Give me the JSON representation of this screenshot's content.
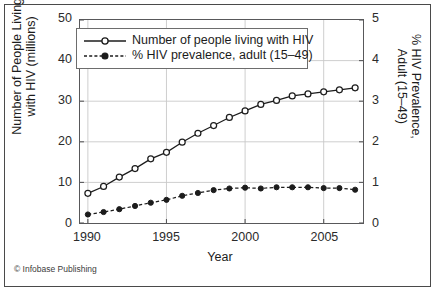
{
  "credit": "© Infobase Publishing",
  "legend": {
    "position": "upper-left-inside",
    "entries": [
      {
        "label": "Number of people living with HIV",
        "marker": "open-circle",
        "line": "solid"
      },
      {
        "label": "% HIV prevalence, adult (15–49)",
        "marker": "filled-circle",
        "line": "dashed"
      }
    ]
  },
  "colors": {
    "line": "#1c1c1c",
    "grid": "#c8c8c8",
    "axis": "#58585a",
    "frame": "#4a4a4a",
    "background": "#ffffff",
    "text": "#1c1c1c"
  },
  "chart_data": {
    "type": "line",
    "title": "",
    "xlabel": "Year",
    "ylabel": "Number of People Living\nwith HIV (millions)",
    "y2label": "% HIV Prevalence,\nAdult (15–49)",
    "xlim": [
      1989.5,
      2007.5
    ],
    "ylim": [
      0,
      50
    ],
    "y2lim": [
      0,
      5
    ],
    "grid": true,
    "xticks": [
      1990,
      1995,
      2000,
      2005
    ],
    "xticklabels": [
      "1990",
      "1995",
      "2000",
      "2005"
    ],
    "yticks": [
      0,
      10,
      20,
      30,
      40,
      50
    ],
    "yticklabels": [
      "0",
      "10",
      "20",
      "30",
      "40",
      "50"
    ],
    "y2ticks": [
      0,
      1,
      2,
      3,
      4,
      5
    ],
    "y2ticklabels": [
      "0",
      "1",
      "2",
      "3",
      "4",
      "5"
    ],
    "x": [
      1990,
      1991,
      1992,
      1993,
      1994,
      1995,
      1996,
      1997,
      1998,
      1999,
      2000,
      2001,
      2002,
      2003,
      2004,
      2005,
      2006,
      2007
    ],
    "series": [
      {
        "name": "Number of people living with HIV",
        "axis": "left",
        "units": "millions",
        "marker": "open-circle",
        "line": "solid",
        "values": [
          7.3,
          9.0,
          11.3,
          13.4,
          15.8,
          17.4,
          19.9,
          22.1,
          24.0,
          26.0,
          27.6,
          29.2,
          30.2,
          31.3,
          31.8,
          32.3,
          32.8,
          33.3
        ]
      },
      {
        "name": "% HIV prevalence, adult (15–49)",
        "axis": "right",
        "units": "percent",
        "marker": "filled-circle",
        "line": "dashed",
        "values": [
          0.21,
          0.27,
          0.34,
          0.42,
          0.5,
          0.57,
          0.67,
          0.74,
          0.81,
          0.85,
          0.87,
          0.85,
          0.88,
          0.88,
          0.88,
          0.86,
          0.86,
          0.82
        ]
      }
    ]
  }
}
